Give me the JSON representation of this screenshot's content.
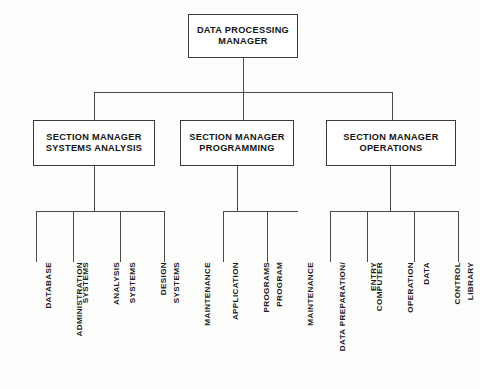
{
  "chart_title": "Data Processing Department Organization Chart",
  "root": {
    "label": "DATA PROCESSING\nMANAGER",
    "line1": "DATA PROCESSING",
    "line2": "MANAGER"
  },
  "sections": [
    {
      "id": "systems-analysis",
      "line1": "SECTION MANAGER",
      "line2": "SYSTEMS ANALYSIS",
      "leaves": [
        {
          "line1": "DATABASE",
          "line2": "ADMINISTRATION"
        },
        {
          "line1": "SYSTEMS",
          "line2": "ANALYSIS"
        },
        {
          "line1": "SYSTEMS",
          "line2": "DESIGN"
        },
        {
          "line1": "SYSTEMS",
          "line2": "MAINTENANCE"
        }
      ]
    },
    {
      "id": "programming",
      "line1": "SECTION MANAGER",
      "line2": "PROGRAMMING",
      "leaves": [
        {
          "line1": "APPLICATION",
          "line2": "PROGRAMS"
        },
        {
          "line1": "PROGRAM",
          "line2": "MAINTENANCE"
        }
      ]
    },
    {
      "id": "operations",
      "line1": "SECTION MANAGER",
      "line2": "OPERATIONS",
      "leaves": [
        {
          "line1": "DATA PREPARATION/",
          "line2": "ENTRY"
        },
        {
          "line1": "COMPUTER",
          "line2": "OPERATION"
        },
        {
          "line1": "DATA",
          "line2": "CONTROL"
        },
        {
          "line1": "LIBRARY",
          "line2": ""
        }
      ]
    }
  ],
  "colors": {
    "box_border": "#3a3a3a",
    "connector": "#4a4a4a",
    "text": "#141414",
    "background": "#fdfdfc"
  }
}
